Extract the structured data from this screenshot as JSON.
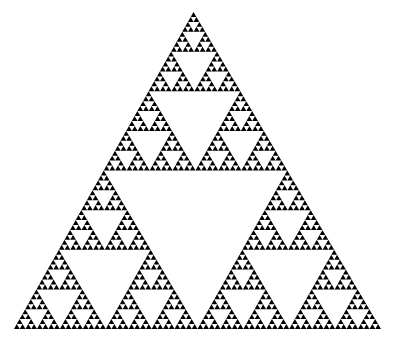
{
  "figure": {
    "type": "sierpinski-triangle",
    "depth": 6,
    "fill_color": "#000000",
    "background_color": "#ffffff",
    "vertices": {
      "apex": [
        193.5,
        12
      ],
      "bottom_left": [
        14,
        329
      ],
      "bottom_right": [
        381,
        329
      ]
    }
  }
}
